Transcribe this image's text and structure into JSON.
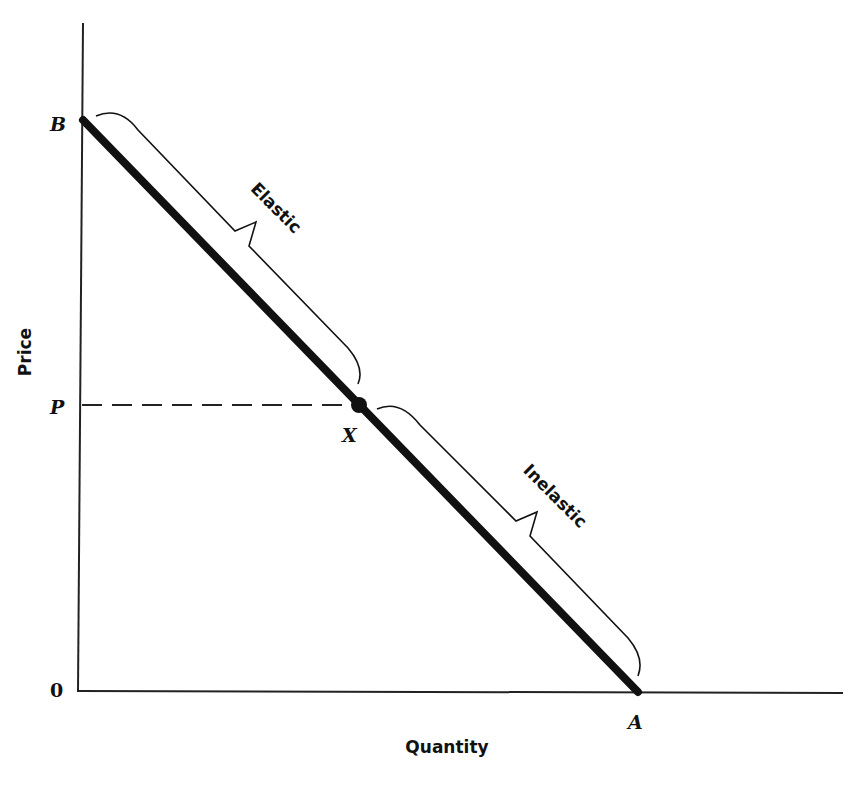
{
  "diagram": {
    "type": "linear-demand-elasticity",
    "axes": {
      "x_label": "Quantity",
      "y_label": "Price",
      "origin_label": "0"
    },
    "points": {
      "B": {
        "label": "B",
        "description": "price intercept"
      },
      "A": {
        "label": "A",
        "description": "quantity intercept"
      },
      "X": {
        "label": "X",
        "description": "midpoint of demand curve"
      },
      "P": {
        "label": "P",
        "description": "price at midpoint"
      }
    },
    "regions": {
      "upper": {
        "label": "Elastic"
      },
      "lower": {
        "label": "Inelastic"
      }
    },
    "colors": {
      "line": "#111111",
      "background": "#ffffff"
    }
  }
}
